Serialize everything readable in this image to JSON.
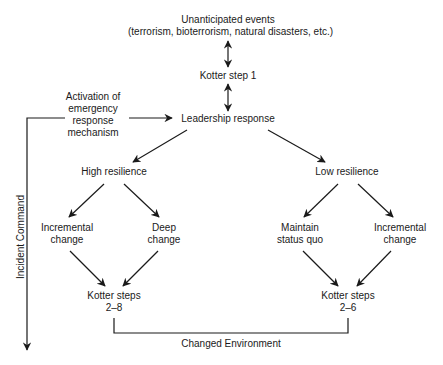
{
  "diagram": {
    "nodes": {
      "unanticipated_events": {
        "line1": "Unanticipated events",
        "line2": "(terrorism, bioterrorism, natural disasters, etc.)"
      },
      "kotter_step_1": {
        "label": "Kotter step 1"
      },
      "activation": {
        "line1": "Activation of",
        "line2": "emergency",
        "line3": "response",
        "line4": "mechanism"
      },
      "leadership_response": {
        "label": "Leadership response"
      },
      "high_resilience": {
        "label": "High resilience"
      },
      "low_resilience": {
        "label": "Low resilience"
      },
      "incremental_change_left": {
        "line1": "Incremental",
        "line2": "change"
      },
      "deep_change": {
        "line1": "Deep",
        "line2": "change"
      },
      "maintain_status_quo": {
        "line1": "Maintain",
        "line2": "status quo"
      },
      "incremental_change_right": {
        "line1": "Incremental",
        "line2": "change"
      },
      "kotter_steps_2_8": {
        "line1": "Kotter steps",
        "line2": "2–8"
      },
      "kotter_steps_2_6": {
        "line1": "Kotter steps",
        "line2": "2–6"
      }
    },
    "side_label": "Incident Command",
    "bottom_label": "Changed Environment",
    "edges": [
      {
        "from": "unanticipated_events",
        "to": "kotter_step_1",
        "type": "bidirectional"
      },
      {
        "from": "kotter_step_1",
        "to": "leadership_response",
        "type": "bidirectional"
      },
      {
        "from": "activation",
        "to": "leadership_response",
        "type": "arrow"
      },
      {
        "from": "leadership_response",
        "to": "high_resilience",
        "type": "arrow"
      },
      {
        "from": "leadership_response",
        "to": "low_resilience",
        "type": "arrow"
      },
      {
        "from": "high_resilience",
        "to": "incremental_change_left",
        "type": "arrow"
      },
      {
        "from": "high_resilience",
        "to": "deep_change",
        "type": "arrow"
      },
      {
        "from": "low_resilience",
        "to": "maintain_status_quo",
        "type": "arrow"
      },
      {
        "from": "low_resilience",
        "to": "incremental_change_right",
        "type": "arrow"
      },
      {
        "from": "incremental_change_left",
        "to": "kotter_steps_2_8",
        "type": "arrow"
      },
      {
        "from": "deep_change",
        "to": "kotter_steps_2_8",
        "type": "arrow"
      },
      {
        "from": "maintain_status_quo",
        "to": "kotter_steps_2_6",
        "type": "arrow"
      },
      {
        "from": "incremental_change_right",
        "to": "kotter_steps_2_6",
        "type": "arrow"
      },
      {
        "from": "kotter_steps_2_8",
        "to": "kotter_steps_2_6",
        "type": "bracket",
        "label": "Changed Environment"
      }
    ],
    "colors": {
      "line": "#1a1a1a",
      "text": "#1a1a1a",
      "background": "#ffffff"
    }
  }
}
